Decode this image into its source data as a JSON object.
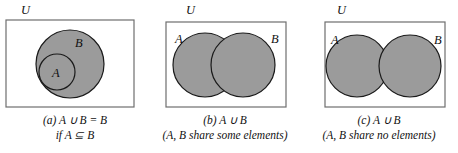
{
  "figure": {
    "fill_color": "#9b9b9b",
    "stroke_color": "#1a1a1a",
    "rect_stroke_color": "#6e6e6e",
    "background": "#ffffff"
  },
  "panels": [
    {
      "id": "a",
      "universe_label": "U",
      "set_labels": {
        "a": "A",
        "b": "B"
      },
      "caption_line1": "(a) A ∪ B = B",
      "caption_line2": "if A ⊆ B",
      "relation": "subset",
      "shapes": {
        "rect": {
          "x": 6,
          "y": 20,
          "w": 128,
          "h": 87
        },
        "circle_b": {
          "cx": 70,
          "cy": 64,
          "r": 34
        },
        "circle_a": {
          "cx": 57,
          "cy": 72,
          "r": 18
        }
      }
    },
    {
      "id": "b",
      "universe_label": "U",
      "set_labels": {
        "a": "A",
        "b": "B"
      },
      "caption_line1": "(b) A ∪ B",
      "caption_line2": "(A, B share some elements)",
      "relation": "overlapping",
      "shapes": {
        "rect": {
          "x": 16,
          "y": 22,
          "w": 120,
          "h": 85
        },
        "circle_a": {
          "cx": 55,
          "cy": 65,
          "r": 32
        },
        "circle_b": {
          "cx": 93,
          "cy": 65,
          "r": 32
        }
      }
    },
    {
      "id": "c",
      "universe_label": "U",
      "set_labels": {
        "a": "A",
        "b": "B"
      },
      "caption_line1": "(c) A ∪ B",
      "caption_line2": "(A, B share no elements)",
      "relation": "disjoint",
      "shapes": {
        "rect": {
          "x": 25,
          "y": 22,
          "w": 120,
          "h": 85
        },
        "circle_a": {
          "cx": 57,
          "cy": 66,
          "r": 31
        },
        "circle_b": {
          "cx": 110,
          "cy": 66,
          "r": 31
        }
      }
    }
  ]
}
